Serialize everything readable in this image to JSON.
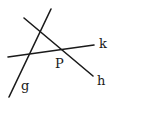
{
  "diagram": {
    "type": "geometry-lines",
    "lines": [
      {
        "name": "g",
        "x1": 51,
        "y1": 9,
        "x2": 9,
        "y2": 97
      },
      {
        "name": "h",
        "x1": 24,
        "y1": 18,
        "x2": 93,
        "y2": 76
      },
      {
        "name": "k",
        "x1": 8,
        "y1": 57,
        "x2": 94,
        "y2": 45
      }
    ],
    "labels": {
      "g": "g",
      "h": "h",
      "k": "k",
      "P": "P"
    },
    "points": [
      {
        "name": "P",
        "description": "intersection of h and k"
      }
    ]
  }
}
